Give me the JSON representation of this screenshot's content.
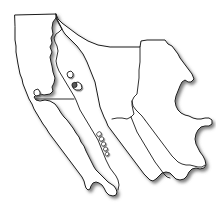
{
  "figure": {
    "kind": "outline-map",
    "title": "Northwestern Mexico outline map",
    "width": 216,
    "height": 224
  },
  "style": {
    "background_color": "#ffffff",
    "outline_color": "#1a1a1a",
    "internal_border_color": "#1a1a1a",
    "shadow_color": "#6b6b6b",
    "island_fill_color": "#ffffff",
    "marker_fill_color": "#5a5a5a",
    "outline_width_px": 1,
    "internal_border_width_px": 0.9
  },
  "regions": [
    {
      "id": "baja-california-norte",
      "name": "Baja California",
      "type": "state"
    },
    {
      "id": "baja-california-sur",
      "name": "Baja California Sur",
      "type": "state"
    },
    {
      "id": "sonora",
      "name": "Sonora",
      "type": "state"
    },
    {
      "id": "chihuahua",
      "name": "Chihuahua",
      "type": "state"
    },
    {
      "id": "sinaloa",
      "name": "Sinaloa",
      "type": "state"
    },
    {
      "id": "durango",
      "name": "Durango",
      "type": "state"
    }
  ],
  "water_bodies": [
    {
      "id": "pacific-ocean",
      "name": "Pacific Ocean"
    },
    {
      "id": "gulf-of-california",
      "name": "Gulf of California"
    }
  ],
  "islands": [
    {
      "id": "island-north-gulf-1",
      "group": "northern-gulf"
    },
    {
      "id": "island-north-gulf-2",
      "group": "northern-gulf"
    },
    {
      "id": "island-midriff-1",
      "group": "midriff"
    },
    {
      "id": "island-midriff-2",
      "group": "midriff"
    },
    {
      "id": "island-midriff-3",
      "group": "midriff"
    },
    {
      "id": "island-midriff-4",
      "group": "midriff"
    },
    {
      "id": "island-midriff-5",
      "group": "midriff"
    },
    {
      "id": "island-pacific-bay",
      "group": "pacific-coast"
    }
  ],
  "labels": []
}
